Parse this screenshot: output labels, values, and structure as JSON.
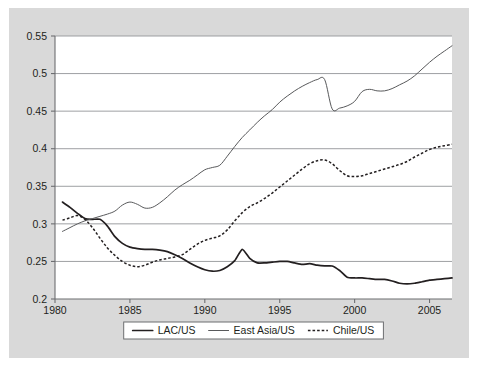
{
  "figure": {
    "background_color": "#ffffff",
    "panel_color": "#d9d9d9",
    "plot_background_color": "#ffffff",
    "gridline_color": "#939598",
    "axis_color": "#6d6e71"
  },
  "chart_data": {
    "type": "line",
    "title": "",
    "subtitle": "",
    "xlabel": "",
    "ylabel": "",
    "xlim": [
      1980,
      2006.5
    ],
    "ylim": [
      0.2,
      0.55
    ],
    "xticks": [
      1980,
      1985,
      1990,
      1995,
      2000,
      2005
    ],
    "xticklabels": [
      "1980",
      "1985",
      "1990",
      "1995",
      "2000",
      "2005"
    ],
    "yticks": [
      0.2,
      0.25,
      0.3,
      0.35,
      0.4,
      0.45,
      0.5,
      0.55
    ],
    "yticklabels": [
      "0.2",
      "0.25",
      "0.3",
      "0.35",
      "0.4",
      "0.45",
      "0.5",
      "0.55"
    ],
    "grid": "horizontal",
    "legend_position": "bottom-center",
    "series": [
      {
        "name": "LAC/US",
        "style": "solid-thick",
        "color": "#231f20",
        "x": [
          1980.5,
          1981.0,
          1981.5,
          1982.0,
          1982.5,
          1983.0,
          1983.5,
          1984.0,
          1984.5,
          1985.0,
          1985.5,
          1986.0,
          1986.5,
          1987.0,
          1987.5,
          1988.0,
          1988.5,
          1989.0,
          1989.5,
          1990.0,
          1990.5,
          1991.0,
          1991.5,
          1992.0,
          1992.5,
          1993.0,
          1993.5,
          1994.0,
          1994.5,
          1995.0,
          1995.5,
          1996.0,
          1996.5,
          1997.0,
          1997.5,
          1998.0,
          1998.5,
          1999.0,
          1999.5,
          2000.0,
          2000.5,
          2001.0,
          2001.5,
          2002.0,
          2002.5,
          2003.0,
          2003.5,
          2004.0,
          2004.5,
          2005.0,
          2005.5,
          2006.0,
          2006.5
        ],
        "y": [
          0.329,
          0.322,
          0.314,
          0.307,
          0.306,
          0.306,
          0.297,
          0.283,
          0.274,
          0.269,
          0.267,
          0.266,
          0.266,
          0.265,
          0.263,
          0.259,
          0.254,
          0.248,
          0.243,
          0.239,
          0.237,
          0.238,
          0.243,
          0.251,
          0.266,
          0.254,
          0.248,
          0.248,
          0.249,
          0.25,
          0.25,
          0.248,
          0.246,
          0.247,
          0.245,
          0.244,
          0.244,
          0.238,
          0.229,
          0.228,
          0.228,
          0.227,
          0.226,
          0.226,
          0.224,
          0.221,
          0.22,
          0.221,
          0.223,
          0.225,
          0.226,
          0.227,
          0.228
        ]
      },
      {
        "name": "East Asia/US",
        "style": "solid-thin",
        "color": "#58595b",
        "x": [
          1980.5,
          1981.0,
          1981.5,
          1982.0,
          1982.5,
          1983.0,
          1983.5,
          1984.0,
          1984.5,
          1985.0,
          1985.5,
          1986.0,
          1986.5,
          1987.0,
          1987.5,
          1988.0,
          1988.5,
          1989.0,
          1989.5,
          1990.0,
          1990.5,
          1991.0,
          1991.5,
          1992.0,
          1992.5,
          1993.0,
          1993.5,
          1994.0,
          1994.5,
          1995.0,
          1995.5,
          1996.0,
          1996.5,
          1997.0,
          1997.5,
          1998.0,
          1998.5,
          1999.0,
          1999.5,
          2000.0,
          2000.5,
          2001.0,
          2001.5,
          2002.0,
          2002.5,
          2003.0,
          2003.5,
          2004.0,
          2004.5,
          2005.0,
          2005.5,
          2006.0,
          2006.5
        ],
        "y": [
          0.29,
          0.295,
          0.3,
          0.304,
          0.307,
          0.31,
          0.313,
          0.317,
          0.325,
          0.329,
          0.326,
          0.321,
          0.322,
          0.328,
          0.336,
          0.345,
          0.352,
          0.358,
          0.365,
          0.372,
          0.375,
          0.378,
          0.39,
          0.403,
          0.415,
          0.425,
          0.435,
          0.444,
          0.452,
          0.462,
          0.47,
          0.477,
          0.483,
          0.488,
          0.492,
          0.492,
          0.453,
          0.454,
          0.457,
          0.463,
          0.476,
          0.479,
          0.477,
          0.477,
          0.48,
          0.485,
          0.49,
          0.497,
          0.506,
          0.515,
          0.523,
          0.53,
          0.537
        ]
      },
      {
        "name": "Chile/US",
        "style": "dashed",
        "color": "#231f20",
        "x": [
          1980.5,
          1981.0,
          1981.5,
          1982.0,
          1982.5,
          1983.0,
          1983.5,
          1984.0,
          1984.5,
          1985.0,
          1985.5,
          1986.0,
          1986.5,
          1987.0,
          1987.5,
          1988.0,
          1988.5,
          1989.0,
          1989.5,
          1990.0,
          1990.5,
          1991.0,
          1991.5,
          1992.0,
          1992.5,
          1993.0,
          1993.5,
          1994.0,
          1994.5,
          1995.0,
          1995.5,
          1996.0,
          1996.5,
          1997.0,
          1997.5,
          1998.0,
          1998.5,
          1999.0,
          1999.5,
          2000.0,
          2000.5,
          2001.0,
          2001.5,
          2002.0,
          2002.5,
          2003.0,
          2003.5,
          2004.0,
          2004.5,
          2005.0,
          2005.5,
          2006.0,
          2006.5
        ],
        "y": [
          0.305,
          0.308,
          0.311,
          0.306,
          0.295,
          0.281,
          0.268,
          0.258,
          0.25,
          0.245,
          0.243,
          0.245,
          0.249,
          0.252,
          0.254,
          0.256,
          0.259,
          0.266,
          0.273,
          0.278,
          0.281,
          0.284,
          0.292,
          0.304,
          0.315,
          0.323,
          0.328,
          0.334,
          0.341,
          0.349,
          0.357,
          0.365,
          0.373,
          0.38,
          0.384,
          0.385,
          0.38,
          0.371,
          0.364,
          0.363,
          0.364,
          0.367,
          0.37,
          0.373,
          0.376,
          0.379,
          0.383,
          0.389,
          0.394,
          0.399,
          0.402,
          0.404,
          0.406
        ]
      }
    ]
  },
  "legend": {
    "entries": [
      {
        "label": "LAC/US",
        "style": "solid-thick"
      },
      {
        "label": "East Asia/US",
        "style": "solid-thin"
      },
      {
        "label": "Chile/US",
        "style": "dashed"
      }
    ]
  }
}
